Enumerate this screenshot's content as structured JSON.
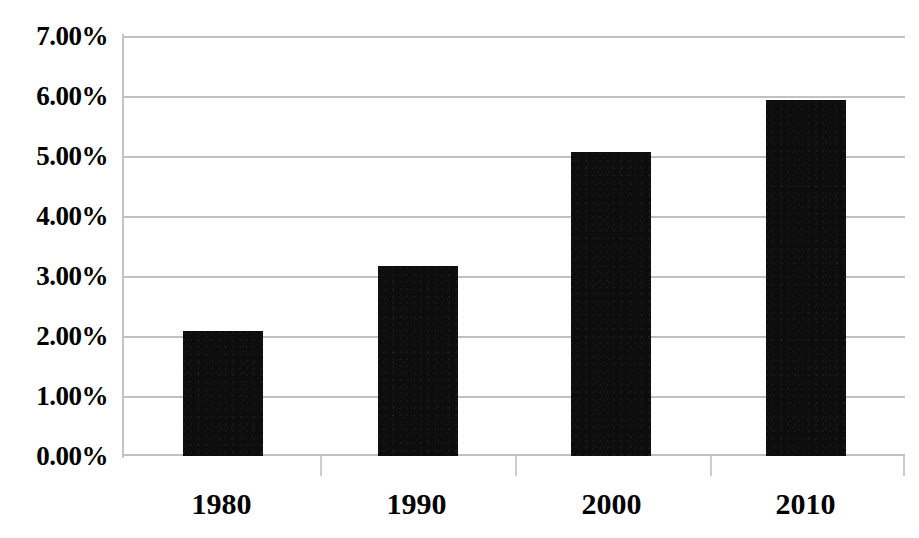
{
  "chart_data": {
    "type": "bar",
    "title": "",
    "subtitle": "",
    "xlabel": "",
    "ylabel": "",
    "categories": [
      "1980",
      "1990",
      "2000",
      "2010"
    ],
    "values": [
      2.08,
      3.17,
      5.07,
      5.93
    ],
    "value_unit": "%",
    "ylim": [
      0,
      7
    ],
    "y_tick_labels": [
      "0.00%",
      "1.00%",
      "2.00%",
      "3.00%",
      "4.00%",
      "5.00%",
      "6.00%",
      "7.00%"
    ],
    "y_tick_values": [
      0,
      1,
      2,
      3,
      4,
      5,
      6,
      7
    ],
    "grid": "horizontal",
    "legend": "none",
    "series": [
      {
        "name": "",
        "values": [
          2.08,
          3.17,
          5.07,
          5.93
        ]
      }
    ],
    "annotations": []
  },
  "style": {
    "bar_color": "#0d0d0d",
    "grid_color": "#c0c0c0",
    "axis_color": "#c4c4c4",
    "text_color": "#000000",
    "background": "#ffffff"
  }
}
